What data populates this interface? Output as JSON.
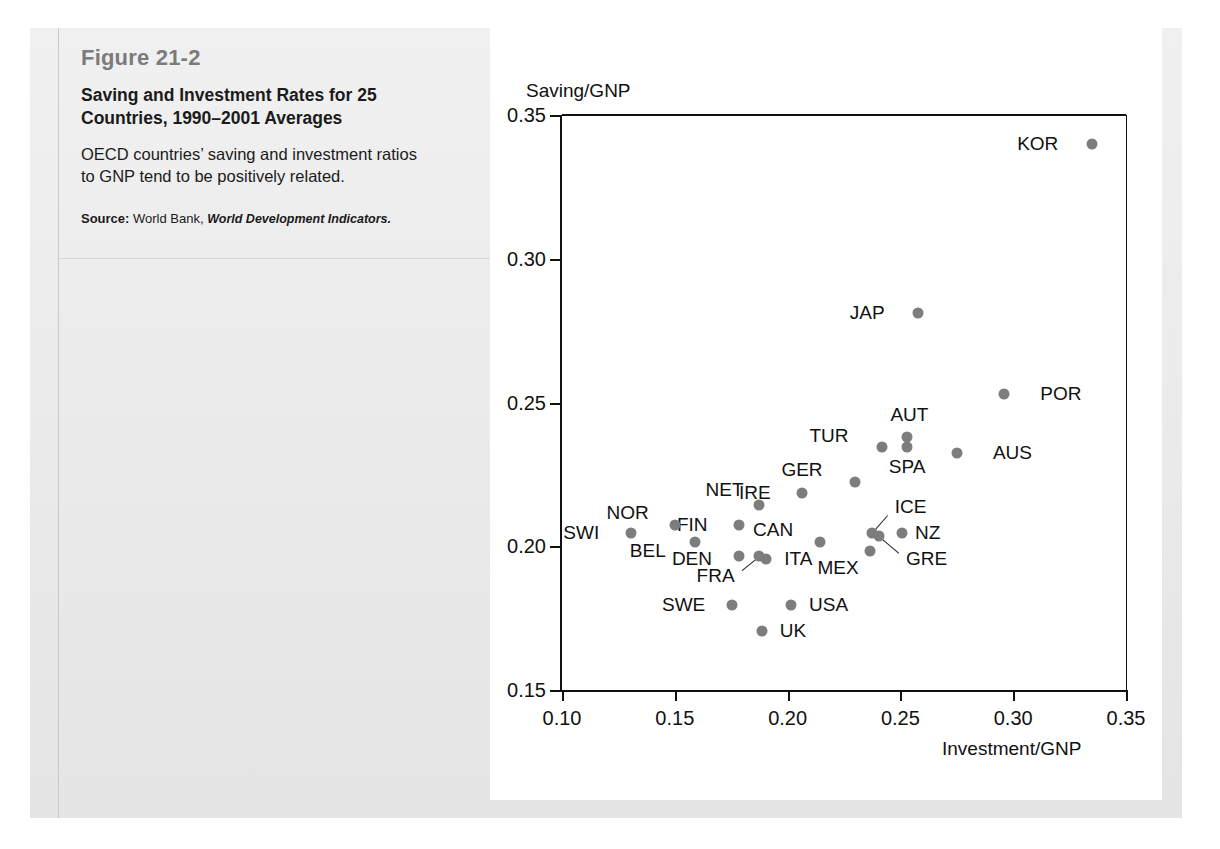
{
  "figure": {
    "number": "Figure 21-2",
    "title": "Saving and Investment Rates for 25 Countries, 1990–2001 Averages",
    "description": "OECD countries’ saving and investment ratios to GNP tend to be positively related.",
    "source_label": "Source:",
    "source_text": " World Bank, ",
    "source_italic": "World Development Indicators."
  },
  "chart_data": {
    "type": "scatter",
    "title": "Saving and Investment Rates for 25 Countries, 1990–2001 Averages",
    "xlabel": "Investment/GNP",
    "ylabel": "Saving/GNP",
    "xlim": [
      0.1,
      0.35
    ],
    "ylim": [
      0.15,
      0.35
    ],
    "xticks": [
      "0.10",
      "0.15",
      "0.20",
      "0.25",
      "0.30",
      "0.35"
    ],
    "yticks": [
      "0.15",
      "0.20",
      "0.25",
      "0.30",
      "0.35"
    ],
    "xtick_values": [
      0.1,
      0.15,
      0.2,
      0.25,
      0.3,
      0.35
    ],
    "ytick_values": [
      0.15,
      0.2,
      0.25,
      0.3,
      0.35
    ],
    "grid": false,
    "legend": "none",
    "marker_color": "#7d7d7d",
    "axis_color": "#111111",
    "points": [
      {
        "label": "KOR",
        "x": 0.335,
        "y": 0.34,
        "lx": 0.32,
        "ly": 0.34,
        "anchor": "right",
        "leader": false
      },
      {
        "label": "JAP",
        "x": 0.258,
        "y": 0.281,
        "lx": 0.243,
        "ly": 0.281,
        "anchor": "right",
        "leader": false
      },
      {
        "label": "POR",
        "x": 0.296,
        "y": 0.253,
        "lx": 0.312,
        "ly": 0.253,
        "anchor": "left",
        "leader": false
      },
      {
        "label": "AUT",
        "x": 0.253,
        "y": 0.238,
        "lx": 0.254,
        "ly": 0.2455,
        "anchor": "center",
        "leader": false
      },
      {
        "label": "SPA",
        "x": 0.253,
        "y": 0.2345,
        "lx": 0.253,
        "ly": 0.2275,
        "anchor": "center",
        "leader": false
      },
      {
        "label": "TUR",
        "x": 0.242,
        "y": 0.2345,
        "lx": 0.227,
        "ly": 0.2385,
        "anchor": "right",
        "leader": false
      },
      {
        "label": "AUS",
        "x": 0.275,
        "y": 0.2325,
        "lx": 0.291,
        "ly": 0.2325,
        "anchor": "left",
        "leader": false
      },
      {
        "label": "GER",
        "x": 0.23,
        "y": 0.2225,
        "lx": 0.2155,
        "ly": 0.2265,
        "anchor": "right",
        "leader": false
      },
      {
        "label": "IRE",
        "x": 0.2065,
        "y": 0.2185,
        "lx": 0.1925,
        "ly": 0.2185,
        "anchor": "right",
        "leader": false
      },
      {
        "label": "NET",
        "x": 0.1875,
        "y": 0.2145,
        "lx": 0.1805,
        "ly": 0.2195,
        "anchor": "right",
        "leader": false
      },
      {
        "label": "FIN",
        "x": 0.1785,
        "y": 0.2075,
        "lx": 0.1645,
        "ly": 0.2075,
        "anchor": "right",
        "leader": false
      },
      {
        "label": "NOR",
        "x": 0.15,
        "y": 0.2075,
        "lx": 0.1385,
        "ly": 0.2115,
        "anchor": "right",
        "leader": false
      },
      {
        "label": "SWI",
        "x": 0.1305,
        "y": 0.2045,
        "lx": 0.1165,
        "ly": 0.2045,
        "anchor": "right",
        "leader": false
      },
      {
        "label": "BEL",
        "x": 0.159,
        "y": 0.2015,
        "lx": 0.146,
        "ly": 0.1985,
        "anchor": "right",
        "leader": false
      },
      {
        "label": "CAN",
        "x": 0.2145,
        "y": 0.2015,
        "lx": 0.2025,
        "ly": 0.2055,
        "anchor": "right",
        "leader": false
      },
      {
        "label": "ICE",
        "x": 0.2375,
        "y": 0.2045,
        "lx": 0.2475,
        "ly": 0.2135,
        "anchor": "left",
        "leader": true
      },
      {
        "label": "GRE",
        "x": 0.2405,
        "y": 0.2035,
        "lx": 0.2525,
        "ly": 0.1955,
        "anchor": "left",
        "leader": true
      },
      {
        "label": "NZ",
        "x": 0.2505,
        "y": 0.2045,
        "lx": 0.2565,
        "ly": 0.2045,
        "anchor": "left",
        "leader": false
      },
      {
        "label": "MEX",
        "x": 0.2365,
        "y": 0.1985,
        "lx": 0.2315,
        "ly": 0.1925,
        "anchor": "right",
        "leader": false
      },
      {
        "label": "DEN",
        "x": 0.1785,
        "y": 0.1965,
        "lx": 0.1665,
        "ly": 0.1955,
        "anchor": "right",
        "leader": false
      },
      {
        "label": "FRA",
        "x": 0.1875,
        "y": 0.1965,
        "lx": 0.1765,
        "ly": 0.1895,
        "anchor": "right",
        "leader": true
      },
      {
        "label": "ITA",
        "x": 0.1905,
        "y": 0.1955,
        "lx": 0.1985,
        "ly": 0.1955,
        "anchor": "left",
        "leader": false
      },
      {
        "label": "SWE",
        "x": 0.1755,
        "y": 0.1795,
        "lx": 0.1635,
        "ly": 0.1795,
        "anchor": "right",
        "leader": false
      },
      {
        "label": "USA",
        "x": 0.2015,
        "y": 0.1795,
        "lx": 0.2095,
        "ly": 0.1795,
        "anchor": "left",
        "leader": false
      },
      {
        "label": "UK",
        "x": 0.1885,
        "y": 0.1705,
        "lx": 0.1965,
        "ly": 0.1705,
        "anchor": "left",
        "leader": false
      }
    ]
  }
}
